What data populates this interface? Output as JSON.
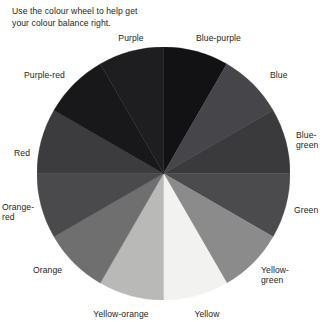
{
  "figure": {
    "name": "colour-wheel-figure",
    "caption": "Use the colour wheel\nto help get your colour\nbalance right.",
    "background": "#ffffff",
    "text_color": "#231f20"
  },
  "wheel": {
    "type": "pie",
    "center": {
      "x": 163.5,
      "y": 173.5
    },
    "radius": 126.5,
    "segment_count": 12,
    "segment_angle_degrees": 30,
    "segments": [
      {
        "label": "Blue-purple",
        "start_angle": 0,
        "end_angle": 30,
        "fill": "#121214"
      },
      {
        "label": "Blue",
        "start_angle": 30,
        "end_angle": 60,
        "fill": "#46464a"
      },
      {
        "label": "Blue-green",
        "start_angle": 60,
        "end_angle": 90,
        "fill": "#3a3a3c"
      },
      {
        "label": "Green",
        "start_angle": 90,
        "end_angle": 120,
        "fill": "#4b4b4d"
      },
      {
        "label": "Yellow-green",
        "start_angle": 120,
        "end_angle": 150,
        "fill": "#8b8b8c"
      },
      {
        "label": "Yellow",
        "start_angle": 150,
        "end_angle": 180,
        "fill": "#f2f2f1"
      },
      {
        "label": "Yellow-orange",
        "start_angle": 180,
        "end_angle": 210,
        "fill": "#b9b9b8"
      },
      {
        "label": "Orange",
        "start_angle": 210,
        "end_angle": 240,
        "fill": "#6f6f70"
      },
      {
        "label": "Orange-red",
        "start_angle": 240,
        "end_angle": 270,
        "fill": "#4a4a4c"
      },
      {
        "label": "Red",
        "start_angle": 270,
        "end_angle": 300,
        "fill": "#3c3c3e"
      },
      {
        "label": "Purple-red",
        "start_angle": 300,
        "end_angle": 330,
        "fill": "#18181a"
      },
      {
        "label": "Purple",
        "start_angle": 330,
        "end_angle": 360,
        "fill": "#1e1e21"
      }
    ]
  },
  "labels": [
    {
      "name": "wheel-label-purple",
      "text": "Purple",
      "x": 131,
      "y": 33,
      "align": "ctr"
    },
    {
      "name": "wheel-label-blue-purple",
      "text": "Blue-purple",
      "x": 196,
      "y": 33,
      "align": "lft"
    },
    {
      "name": "wheel-label-blue",
      "text": "Blue",
      "x": 270,
      "y": 70,
      "align": "lft"
    },
    {
      "name": "wheel-label-blue-green",
      "text": "Blue-\ngreen",
      "x": 296,
      "y": 130,
      "align": "lft"
    },
    {
      "name": "wheel-label-green",
      "text": "Green",
      "x": 294,
      "y": 205,
      "align": "lft"
    },
    {
      "name": "wheel-label-yellow-green",
      "text": "Yellow-\ngreen",
      "x": 261,
      "y": 265,
      "align": "lft"
    },
    {
      "name": "wheel-label-yellow",
      "text": "Yellow",
      "x": 207,
      "y": 309,
      "align": "ctr"
    },
    {
      "name": "wheel-label-yellow-orange",
      "text": "Yellow-orange",
      "x": 121,
      "y": 309,
      "align": "ctr"
    },
    {
      "name": "wheel-label-orange",
      "text": "Orange",
      "x": 33,
      "y": 265,
      "align": "lft"
    },
    {
      "name": "wheel-label-orange-red",
      "text": "Orange-\nred",
      "x": 2,
      "y": 202,
      "align": "lft"
    },
    {
      "name": "wheel-label-red",
      "text": "Red",
      "x": 14,
      "y": 148,
      "align": "lft"
    },
    {
      "name": "wheel-label-purple-red",
      "text": "Purple-red",
      "x": 24,
      "y": 70,
      "align": "lft"
    }
  ]
}
